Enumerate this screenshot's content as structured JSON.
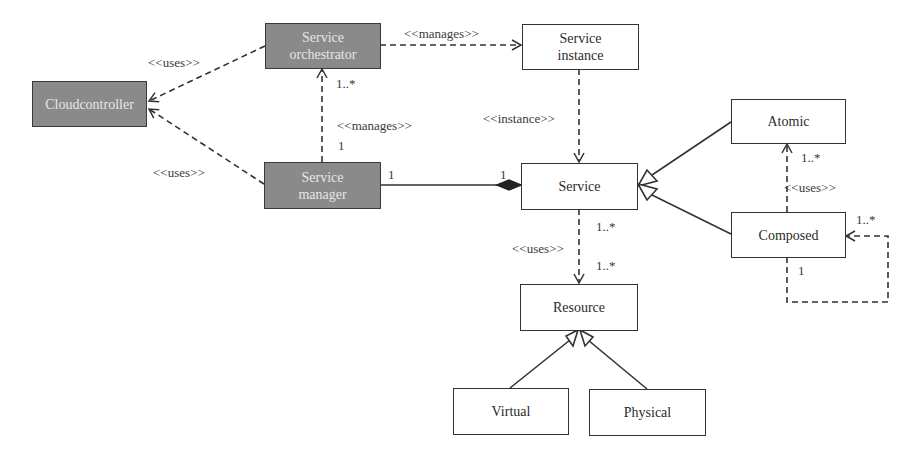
{
  "diagram": {
    "type": "UML class diagram",
    "colors": {
      "dark_fill": "#8a8a8a",
      "dark_text": "#e6e6e6",
      "light_fill": "#ffffff",
      "stroke": "#333333"
    },
    "classes": {
      "cloudcontroller": {
        "label": "Cloudcontroller",
        "style": "dark"
      },
      "service_orchestrator": {
        "label": "Service\norchestrator",
        "style": "dark"
      },
      "service_manager": {
        "label": "Service\nmanager",
        "style": "dark"
      },
      "service_instance": {
        "label": "Service\ninstance",
        "style": "light"
      },
      "service": {
        "label": "Service",
        "style": "light"
      },
      "atomic": {
        "label": "Atomic",
        "style": "light"
      },
      "composed": {
        "label": "Composed",
        "style": "light"
      },
      "resource": {
        "label": "Resource",
        "style": "light"
      },
      "virtual": {
        "label": "Virtual",
        "style": "light"
      },
      "physical": {
        "label": "Physical",
        "style": "light"
      }
    },
    "relations": {
      "orchestrator_uses_cloud": {
        "type": "dependency",
        "from": "Service orchestrator",
        "to": "Cloudcontroller",
        "stereotype": "<<uses>>"
      },
      "manager_uses_cloud": {
        "type": "dependency",
        "from": "Service manager",
        "to": "Cloudcontroller",
        "stereotype": "<<uses>>"
      },
      "orchestrator_manages_instance": {
        "type": "dependency",
        "from": "Service orchestrator",
        "to": "Service instance",
        "stereotype": "<<manages>>"
      },
      "manager_manages_orchestrator": {
        "type": "dependency",
        "from": "Service manager",
        "to": "Service orchestrator",
        "stereotype": "<<manages>>",
        "source_mult": "1",
        "target_mult": "1..*"
      },
      "instance_of_service": {
        "type": "dependency",
        "from": "Service instance",
        "to": "Service",
        "stereotype": "<<instance>>"
      },
      "manager_composes_service": {
        "type": "composition",
        "from": "Service manager",
        "to": "Service",
        "source_mult": "1",
        "target_mult": "1"
      },
      "atomic_is_service": {
        "type": "generalization",
        "from": "Atomic",
        "to": "Service"
      },
      "composed_is_service": {
        "type": "generalization",
        "from": "Composed",
        "to": "Service"
      },
      "composed_uses_atomic": {
        "type": "dependency",
        "from": "Composed",
        "to": "Atomic",
        "stereotype": "<<uses>>",
        "target_mult": "1..*"
      },
      "composed_self": {
        "type": "dependency",
        "from": "Composed",
        "to": "Composed",
        "source_mult": "1",
        "target_mult": "1..*"
      },
      "service_uses_resource": {
        "type": "dependency",
        "from": "Service",
        "to": "Resource",
        "stereotype": "<<uses>>",
        "source_mult": "1..*",
        "target_mult": "1..*"
      },
      "virtual_is_resource": {
        "type": "generalization",
        "from": "Virtual",
        "to": "Resource"
      },
      "physical_is_resource": {
        "type": "generalization",
        "from": "Physical",
        "to": "Resource"
      }
    },
    "labels": {
      "uses_top": "<<uses>>",
      "uses_bottom": "<<uses>>",
      "manages_top": "<<manages>>",
      "manages_mid": "<<manages>>",
      "mult_orch": "1..*",
      "mult_mgr_up": "1",
      "mult_mgr_right": "1",
      "mult_service_left": "1",
      "instance": "<<instance>>",
      "uses_resource": "<<uses>>",
      "mult_service_down": "1..*",
      "mult_resource_top": "1..*",
      "mult_atomic": "1..*",
      "uses_atomic": "<<uses>>",
      "mult_composed_self_in": "1..*",
      "mult_composed_self_out": "1"
    }
  }
}
